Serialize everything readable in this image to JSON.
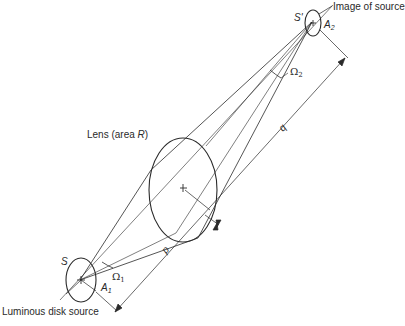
{
  "diagram": {
    "type": "optics-geometry",
    "labels": {
      "image_of_source": "Image of source",
      "lens": "Lens (area ",
      "lens_var": "R",
      "lens_close": ")",
      "luminous_source": "Luminous disk source",
      "source_S": "S",
      "image_S": "S'",
      "A1": "A",
      "A1_sub": "1",
      "A2": "A",
      "A2_sub": "2",
      "omega1": "Ω",
      "omega1_sub": "1",
      "omega2": "Ω",
      "omega2_sub": "2",
      "p": "p",
      "q": "q"
    },
    "colors": {
      "line": "#2a2a2a",
      "background": "#ffffff"
    }
  }
}
